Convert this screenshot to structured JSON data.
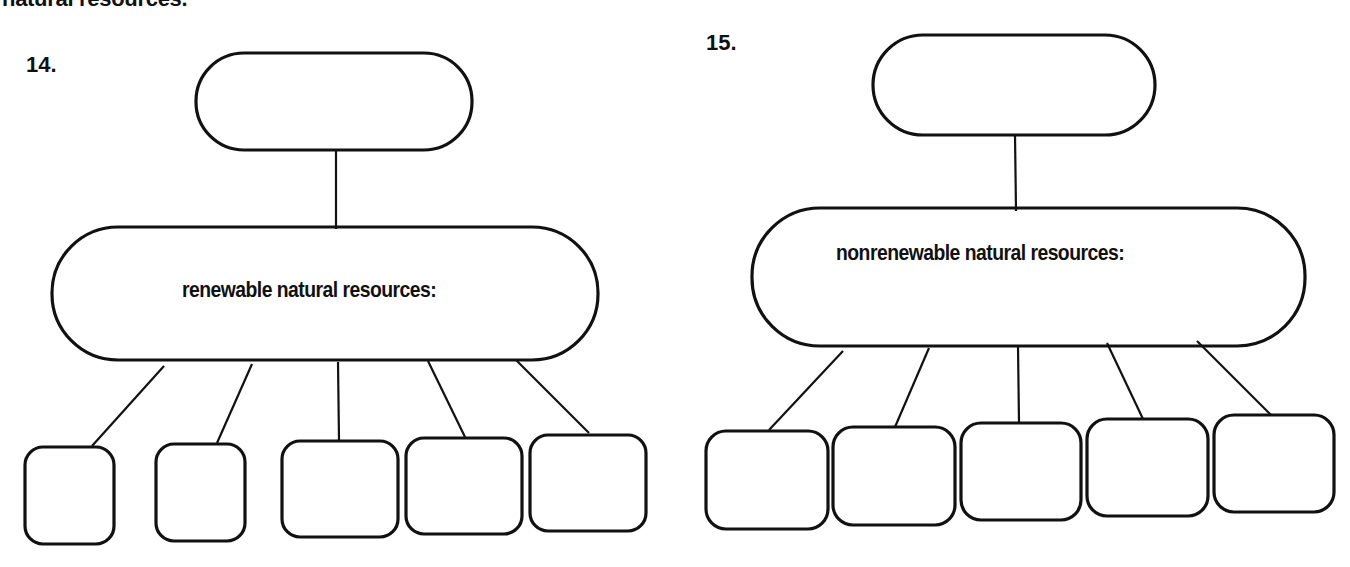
{
  "header": {
    "partial_text": "natural resources."
  },
  "diagrams": [
    {
      "number": "14.",
      "top_box": {
        "text": ""
      },
      "main_box": {
        "text": "renewable natural resources:"
      },
      "child_boxes": [
        "",
        "",
        "",
        "",
        ""
      ]
    },
    {
      "number": "15.",
      "top_box": {
        "text": ""
      },
      "main_box": {
        "text": "nonrenewable natural resources:"
      },
      "child_boxes": [
        "",
        "",
        "",
        "",
        ""
      ]
    }
  ],
  "colors": {
    "ink": "#111111",
    "background": "#ffffff"
  }
}
